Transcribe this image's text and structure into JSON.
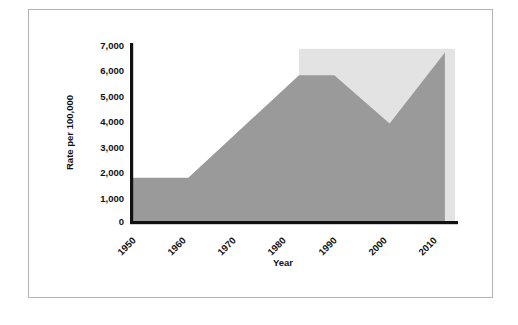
{
  "chart_data": {
    "type": "area",
    "title": "",
    "xlabel": "Year",
    "ylabel": "Rate per 100,000",
    "xlim": [
      1950,
      2014
    ],
    "ylim": [
      0,
      7000
    ],
    "grid": false,
    "legend": "none",
    "x_ticks": [
      "1950",
      "1960",
      "1970",
      "1980",
      "1990",
      "2000",
      "2010"
    ],
    "x_tick_values": [
      1950,
      1960,
      1970,
      1980,
      1990,
      2000,
      2010
    ],
    "y_ticks": [
      "0",
      "1,000",
      "2,000",
      "3,000",
      "4,000",
      "5,000",
      "6,000",
      "7,000"
    ],
    "y_tick_values": [
      0,
      1000,
      2000,
      3000,
      4000,
      5000,
      6000,
      7000
    ],
    "x": [
      1950,
      1961,
      1983,
      1990,
      2001,
      2012
    ],
    "values": [
      1750,
      1750,
      5800,
      5800,
      3900,
      6700
    ],
    "series": [
      {
        "name": "Rate per 100,000",
        "x": [
          1950,
          1961,
          1983,
          1990,
          2001,
          2012
        ],
        "values": [
          1750,
          1750,
          5800,
          5800,
          3900,
          6700
        ]
      }
    ],
    "annotations": [
      {
        "name": "highlight-band",
        "x_start": 1983,
        "x_end": 2014,
        "y_start": 0,
        "y_end": 6850
      }
    ],
    "colors": {
      "area_fill": "#9a9a9a",
      "highlight_band": "#e3e3e3",
      "axis": "#111111",
      "frame_border": "#b3b3b3",
      "background": "#ffffff"
    }
  }
}
